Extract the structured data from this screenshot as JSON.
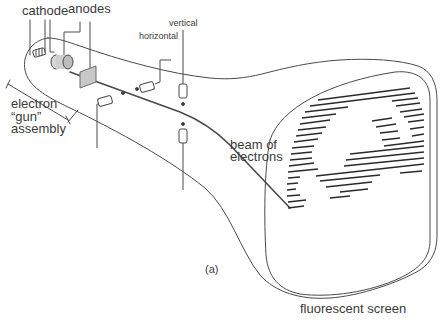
{
  "figure": {
    "panel_label": "(a)",
    "colors": {
      "line": "#4a4a4a",
      "text": "#3a3a3a",
      "background": "#ffffff",
      "anode_plate": "#c8c8c8"
    }
  },
  "labels": {
    "cathode": "cathode",
    "anodes": "anodes",
    "horizontal": "horizontal",
    "vertical": "vertical",
    "electron_gun_line1": "electron",
    "electron_gun_line2": "“gun”",
    "electron_gun_line3": "assembly",
    "beam_line1": "beam of",
    "beam_line2": "electrons",
    "screen": "fluorescent screen",
    "panel": "(a)"
  },
  "components": [
    {
      "id": "cathode",
      "kind": "heater-coil"
    },
    {
      "id": "anode-cylinder",
      "kind": "anode"
    },
    {
      "id": "anode-plate",
      "kind": "anode"
    },
    {
      "id": "horizontal-deflection-coils",
      "kind": "coil-pair"
    },
    {
      "id": "vertical-deflection-coils",
      "kind": "coil-pair"
    },
    {
      "id": "electron-beam",
      "kind": "beam"
    },
    {
      "id": "fluorescent-screen",
      "kind": "screen",
      "content": "raster image of a baby"
    }
  ]
}
